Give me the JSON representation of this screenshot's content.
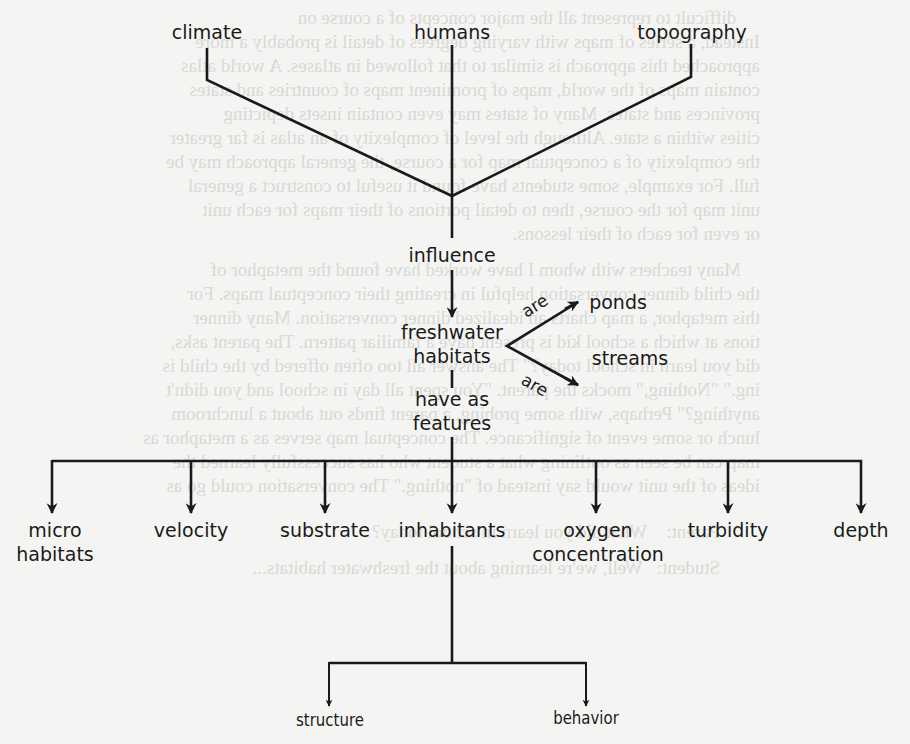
{
  "diagram": {
    "nodes": {
      "climate": "climate",
      "humans": "humans",
      "topography": "topography",
      "influence": "influence",
      "freshwater_habitats": [
        "freshwater",
        "habitats"
      ],
      "ponds": "ponds",
      "streams": "streams",
      "have_as_features": [
        "have as",
        "features"
      ],
      "micro_habitats": [
        "micro",
        "habitats"
      ],
      "velocity": "velocity",
      "substrate": "substrate",
      "inhabitants": "inhabitants",
      "oxygen_concentration": [
        "oxygen",
        "concentration"
      ],
      "turbidity": "turbidity",
      "depth": "depth",
      "structure": "structure",
      "behavior": "behavior"
    },
    "link_labels": {
      "are_ponds": "are",
      "are_streams": "are"
    },
    "edges": [
      {
        "from": "climate",
        "to": "influence"
      },
      {
        "from": "humans",
        "to": "influence"
      },
      {
        "from": "topography",
        "to": "influence"
      },
      {
        "from": "influence",
        "to": "freshwater habitats"
      },
      {
        "from": "freshwater habitats",
        "to": "ponds",
        "label": "are"
      },
      {
        "from": "freshwater habitats",
        "to": "streams",
        "label": "are"
      },
      {
        "from": "freshwater habitats",
        "to": "have as features"
      },
      {
        "from": "have as features",
        "to": "micro habitats"
      },
      {
        "from": "have as features",
        "to": "velocity"
      },
      {
        "from": "have as features",
        "to": "substrate"
      },
      {
        "from": "have as features",
        "to": "inhabitants"
      },
      {
        "from": "have as features",
        "to": "oxygen concentration"
      },
      {
        "from": "have as features",
        "to": "turbidity"
      },
      {
        "from": "have as features",
        "to": "depth"
      },
      {
        "from": "inhabitants",
        "to": "structure"
      },
      {
        "from": "inhabitants",
        "to": "behavior"
      }
    ],
    "colors": {
      "ink": "#1a1a1a",
      "paper": "#f4f4f2",
      "bleed_through": "#d9d9d6"
    }
  }
}
